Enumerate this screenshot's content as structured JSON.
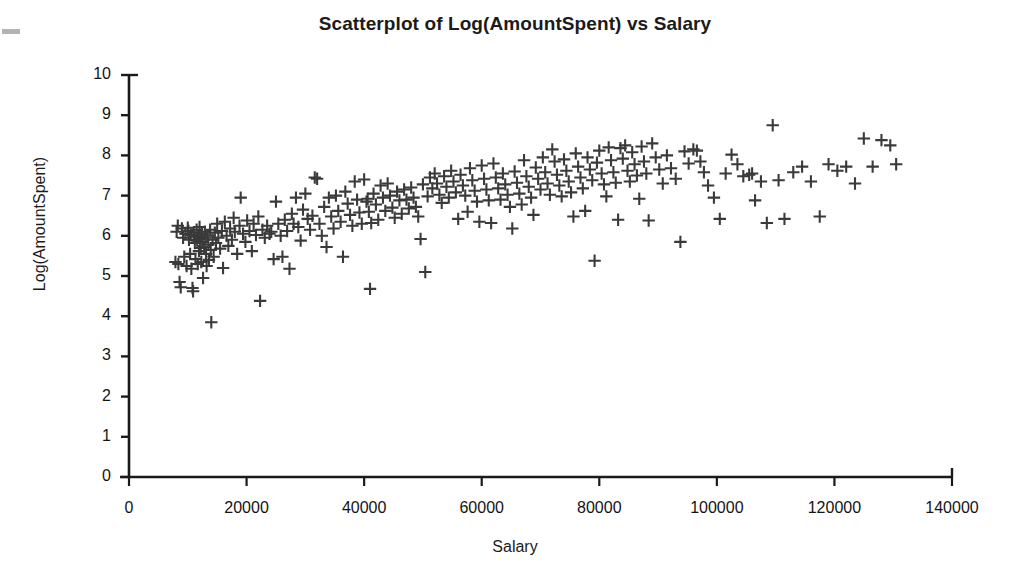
{
  "chart_data": {
    "type": "scatter",
    "title": "Scatterplot of Log(AmountSpent) vs Salary",
    "xlabel": "Salary",
    "ylabel": "Log(AmountSpent)",
    "xlim": [
      0,
      140000
    ],
    "ylim": [
      0,
      10
    ],
    "xticks": [
      0,
      20000,
      40000,
      60000,
      80000,
      100000,
      120000,
      140000
    ],
    "xtick_labels": [
      "0",
      "20000",
      "40000",
      "60000",
      "80000",
      "100000",
      "120000",
      "140000"
    ],
    "yticks": [
      0,
      1,
      2,
      3,
      4,
      5,
      6,
      7,
      8,
      9,
      10
    ],
    "ytick_labels": [
      "0",
      "1",
      "2",
      "3",
      "4",
      "5",
      "6",
      "7",
      "8",
      "9",
      "10"
    ],
    "grid": false,
    "legend": null,
    "marker": "plus",
    "marker_color": "#3a3a3a",
    "axis_color": "#1a1a1a",
    "series": [
      {
        "name": "Log(AmountSpent) vs Salary",
        "points": [
          [
            7900,
            5.35
          ],
          [
            8100,
            6.1
          ],
          [
            8300,
            6.25
          ],
          [
            8400,
            5.3
          ],
          [
            8600,
            4.85
          ],
          [
            8800,
            4.72
          ],
          [
            9000,
            6.18
          ],
          [
            9200,
            5.95
          ],
          [
            9400,
            5.48
          ],
          [
            9600,
            6.05
          ],
          [
            9800,
            5.25
          ],
          [
            10000,
            6.2
          ],
          [
            10100,
            6.12
          ],
          [
            10200,
            5.9
          ],
          [
            10400,
            5.55
          ],
          [
            10500,
            6.02
          ],
          [
            10600,
            5.18
          ],
          [
            10800,
            4.7
          ],
          [
            10900,
            4.62
          ],
          [
            11000,
            6.08
          ],
          [
            11100,
            5.98
          ],
          [
            11200,
            5.82
          ],
          [
            11300,
            5.42
          ],
          [
            11500,
            6.15
          ],
          [
            11600,
            5.88
          ],
          [
            11700,
            5.3
          ],
          [
            11800,
            6.0
          ],
          [
            11900,
            5.62
          ],
          [
            12000,
            6.22
          ],
          [
            12100,
            5.92
          ],
          [
            12200,
            5.7
          ],
          [
            12300,
            5.35
          ],
          [
            12400,
            6.05
          ],
          [
            12500,
            5.85
          ],
          [
            12600,
            4.95
          ],
          [
            12800,
            5.72
          ],
          [
            12900,
            6.1
          ],
          [
            13000,
            5.95
          ],
          [
            13100,
            5.55
          ],
          [
            13200,
            5.25
          ],
          [
            13400,
            6.0
          ],
          [
            13500,
            5.78
          ],
          [
            13600,
            5.4
          ],
          [
            13800,
            6.15
          ],
          [
            13900,
            5.65
          ],
          [
            14000,
            3.85
          ],
          [
            14200,
            5.9
          ],
          [
            14400,
            5.48
          ],
          [
            14600,
            6.08
          ],
          [
            14800,
            5.82
          ],
          [
            15000,
            6.3
          ],
          [
            15200,
            5.95
          ],
          [
            15500,
            5.68
          ],
          [
            15800,
            6.12
          ],
          [
            16000,
            5.2
          ],
          [
            16300,
            6.35
          ],
          [
            16600,
            6.0
          ],
          [
            16900,
            5.75
          ],
          [
            17200,
            6.18
          ],
          [
            17500,
            5.9
          ],
          [
            17800,
            6.45
          ],
          [
            18000,
            6.1
          ],
          [
            18400,
            5.55
          ],
          [
            18800,
            6.25
          ],
          [
            19000,
            6.95
          ],
          [
            19400,
            6.05
          ],
          [
            19800,
            5.85
          ],
          [
            20100,
            6.38
          ],
          [
            20500,
            6.12
          ],
          [
            20900,
            5.62
          ],
          [
            21200,
            6.3
          ],
          [
            21600,
            6.02
          ],
          [
            22000,
            6.48
          ],
          [
            22300,
            4.38
          ],
          [
            22700,
            6.15
          ],
          [
            23100,
            5.95
          ],
          [
            23500,
            6.25
          ],
          [
            23900,
            6.05
          ],
          [
            24200,
            6.1
          ],
          [
            24600,
            5.42
          ],
          [
            25000,
            6.85
          ],
          [
            25400,
            6.3
          ],
          [
            25800,
            6.0
          ],
          [
            26100,
            5.48
          ],
          [
            26500,
            6.4
          ],
          [
            26900,
            6.12
          ],
          [
            27300,
            5.18
          ],
          [
            27700,
            6.55
          ],
          [
            28000,
            6.3
          ],
          [
            28400,
            6.95
          ],
          [
            28800,
            6.22
          ],
          [
            29200,
            5.88
          ],
          [
            29600,
            6.65
          ],
          [
            30000,
            7.05
          ],
          [
            30400,
            6.42
          ],
          [
            30800,
            6.15
          ],
          [
            31200,
            6.5
          ],
          [
            31600,
            7.45
          ],
          [
            32000,
            7.42
          ],
          [
            32400,
            6.3
          ],
          [
            32800,
            6.0
          ],
          [
            33200,
            6.72
          ],
          [
            33600,
            5.72
          ],
          [
            34000,
            6.95
          ],
          [
            34400,
            6.48
          ],
          [
            34800,
            6.18
          ],
          [
            35200,
            7.0
          ],
          [
            35600,
            6.62
          ],
          [
            36000,
            6.35
          ],
          [
            36400,
            5.48
          ],
          [
            36800,
            7.1
          ],
          [
            37200,
            6.8
          ],
          [
            37600,
            6.52
          ],
          [
            38000,
            6.25
          ],
          [
            38400,
            7.35
          ],
          [
            38800,
            6.9
          ],
          [
            39200,
            6.58
          ],
          [
            39600,
            6.3
          ],
          [
            40000,
            7.4
          ],
          [
            40400,
            6.85
          ],
          [
            40600,
            6.92
          ],
          [
            40800,
            6.6
          ],
          [
            41000,
            4.68
          ],
          [
            41200,
            6.32
          ],
          [
            41600,
            7.05
          ],
          [
            42000,
            6.78
          ],
          [
            42400,
            6.4
          ],
          [
            42800,
            7.25
          ],
          [
            43200,
            6.95
          ],
          [
            43600,
            6.62
          ],
          [
            44000,
            7.3
          ],
          [
            44400,
            7.0
          ],
          [
            44800,
            6.7
          ],
          [
            45200,
            6.45
          ],
          [
            45600,
            7.1
          ],
          [
            46000,
            6.88
          ],
          [
            46400,
            6.55
          ],
          [
            46800,
            7.15
          ],
          [
            47200,
            6.9
          ],
          [
            47600,
            6.68
          ],
          [
            48000,
            7.2
          ],
          [
            48400,
            6.95
          ],
          [
            48800,
            6.72
          ],
          [
            49200,
            6.48
          ],
          [
            49600,
            5.92
          ],
          [
            50000,
            7.28
          ],
          [
            50400,
            5.1
          ],
          [
            50800,
            6.98
          ],
          [
            51200,
            7.45
          ],
          [
            51600,
            7.18
          ],
          [
            52000,
            7.55
          ],
          [
            52400,
            7.3
          ],
          [
            52800,
            7.02
          ],
          [
            53200,
            6.82
          ],
          [
            53600,
            7.48
          ],
          [
            54000,
            7.22
          ],
          [
            54400,
            6.95
          ],
          [
            54800,
            7.62
          ],
          [
            55200,
            7.35
          ],
          [
            55600,
            7.08
          ],
          [
            56000,
            6.42
          ],
          [
            56400,
            7.52
          ],
          [
            56800,
            7.25
          ],
          [
            57200,
            7.0
          ],
          [
            57600,
            6.6
          ],
          [
            58000,
            7.68
          ],
          [
            58400,
            7.38
          ],
          [
            58800,
            7.12
          ],
          [
            59200,
            6.85
          ],
          [
            59600,
            6.35
          ],
          [
            60000,
            7.75
          ],
          [
            60400,
            7.42
          ],
          [
            60800,
            7.15
          ],
          [
            61200,
            6.88
          ],
          [
            61600,
            6.32
          ],
          [
            62000,
            7.8
          ],
          [
            62400,
            7.45
          ],
          [
            62800,
            7.18
          ],
          [
            63200,
            6.9
          ],
          [
            63600,
            7.55
          ],
          [
            64000,
            7.28
          ],
          [
            64400,
            7.02
          ],
          [
            64800,
            6.72
          ],
          [
            65200,
            6.18
          ],
          [
            65600,
            7.6
          ],
          [
            66000,
            7.32
          ],
          [
            66400,
            7.05
          ],
          [
            66800,
            6.78
          ],
          [
            67200,
            7.88
          ],
          [
            67600,
            7.48
          ],
          [
            68000,
            7.22
          ],
          [
            68400,
            6.95
          ],
          [
            68800,
            6.52
          ],
          [
            69200,
            7.7
          ],
          [
            69600,
            7.42
          ],
          [
            70000,
            7.15
          ],
          [
            70400,
            7.95
          ],
          [
            70800,
            7.58
          ],
          [
            71200,
            7.3
          ],
          [
            71600,
            7.02
          ],
          [
            72000,
            8.15
          ],
          [
            72400,
            7.85
          ],
          [
            72800,
            7.52
          ],
          [
            73200,
            7.25
          ],
          [
            73600,
            6.98
          ],
          [
            74000,
            7.9
          ],
          [
            74400,
            7.62
          ],
          [
            74800,
            7.35
          ],
          [
            75200,
            7.08
          ],
          [
            75600,
            6.48
          ],
          [
            76000,
            8.05
          ],
          [
            76400,
            7.72
          ],
          [
            76800,
            7.45
          ],
          [
            77200,
            7.18
          ],
          [
            77600,
            6.62
          ],
          [
            78000,
            7.95
          ],
          [
            78400,
            7.65
          ],
          [
            78800,
            7.38
          ],
          [
            79200,
            5.38
          ],
          [
            79600,
            7.82
          ],
          [
            80000,
            8.12
          ],
          [
            80400,
            7.55
          ],
          [
            80800,
            7.28
          ],
          [
            81200,
            6.98
          ],
          [
            81600,
            8.2
          ],
          [
            82000,
            7.88
          ],
          [
            82400,
            7.58
          ],
          [
            82800,
            7.32
          ],
          [
            83200,
            6.4
          ],
          [
            83600,
            8.18
          ],
          [
            84000,
            7.92
          ],
          [
            84400,
            8.25
          ],
          [
            84800,
            7.62
          ],
          [
            85200,
            7.35
          ],
          [
            85600,
            8.08
          ],
          [
            86000,
            7.78
          ],
          [
            86400,
            7.5
          ],
          [
            86800,
            6.92
          ],
          [
            87200,
            8.22
          ],
          [
            87600,
            7.85
          ],
          [
            88000,
            7.55
          ],
          [
            88400,
            6.38
          ],
          [
            89000,
            8.3
          ],
          [
            89600,
            7.95
          ],
          [
            90200,
            7.65
          ],
          [
            90800,
            7.3
          ],
          [
            91500,
            8.0
          ],
          [
            92200,
            7.68
          ],
          [
            93000,
            7.42
          ],
          [
            93800,
            5.85
          ],
          [
            94500,
            8.1
          ],
          [
            95200,
            7.8
          ],
          [
            96000,
            8.15
          ],
          [
            96600,
            8.12
          ],
          [
            97200,
            7.85
          ],
          [
            97800,
            7.58
          ],
          [
            98500,
            7.25
          ],
          [
            99500,
            6.95
          ],
          [
            100500,
            6.42
          ],
          [
            101500,
            7.55
          ],
          [
            102500,
            8.02
          ],
          [
            103500,
            7.78
          ],
          [
            104500,
            7.48
          ],
          [
            105500,
            7.52
          ],
          [
            106000,
            7.55
          ],
          [
            106500,
            6.88
          ],
          [
            107500,
            7.35
          ],
          [
            108500,
            6.32
          ],
          [
            109500,
            8.75
          ],
          [
            110500,
            7.38
          ],
          [
            111500,
            6.42
          ],
          [
            113000,
            7.58
          ],
          [
            114500,
            7.72
          ],
          [
            116000,
            7.35
          ],
          [
            117500,
            6.48
          ],
          [
            119000,
            7.78
          ],
          [
            120500,
            7.62
          ],
          [
            122000,
            7.72
          ],
          [
            123500,
            7.3
          ],
          [
            125000,
            8.42
          ],
          [
            126500,
            7.72
          ],
          [
            128000,
            8.38
          ],
          [
            129500,
            8.25
          ],
          [
            130500,
            7.78
          ]
        ]
      }
    ]
  },
  "geometry": {
    "plot_left_px": 129,
    "plot_right_px": 952,
    "plot_top_px": 75,
    "plot_bottom_px": 477
  }
}
